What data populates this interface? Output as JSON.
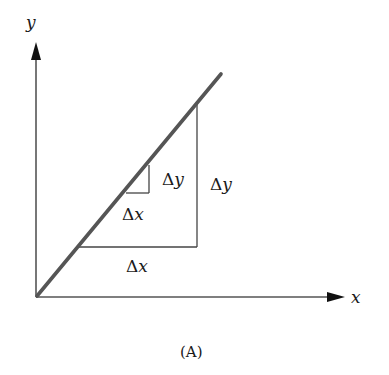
{
  "diagram": {
    "axes": {
      "x_label": "x",
      "y_label": "y",
      "origin": [
        36,
        297
      ],
      "x_axis_end": [
        345,
        297
      ],
      "y_axis_end": [
        36,
        42
      ]
    },
    "line": {
      "start": [
        36,
        297
      ],
      "end": [
        221,
        74
      ],
      "color": "#555555"
    },
    "small_triangle": {
      "dx_label": "Δx",
      "dy_label": "Δy"
    },
    "large_triangle": {
      "dx_label": "Δx",
      "dy_label": "Δy"
    },
    "caption": "(A)"
  }
}
